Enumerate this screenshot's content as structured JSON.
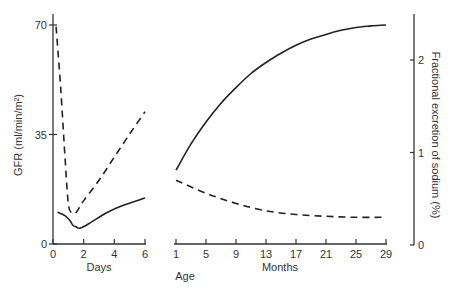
{
  "chart_data": {
    "type": "line",
    "title": "",
    "left_axis": {
      "label": "GFR (ml/min/m²)",
      "ticks": [
        0,
        35,
        70
      ],
      "range": [
        0,
        70
      ]
    },
    "right_axis": {
      "label": "Fractional excretion of sodium (%)",
      "ticks": [
        0,
        1,
        2
      ],
      "range": [
        0,
        2.4
      ]
    },
    "panels": [
      {
        "name": "days",
        "xlabel": "Days",
        "x_ticks": [
          0,
          2,
          4,
          6
        ],
        "xlim": [
          0,
          6
        ],
        "series": [
          {
            "name": "GFR",
            "style": "solid",
            "axis": "left",
            "x": [
              0.3,
              0.8,
              1.1,
              1.3,
              1.5,
              1.8,
              2.5,
              3.5,
              4.5,
              6.0
            ],
            "y": [
              10.2,
              9.0,
              7.5,
              6.0,
              5.5,
              5.1,
              7.0,
              10.0,
              12.2,
              14.7
            ]
          },
          {
            "name": "Fractional excretion of sodium",
            "style": "dashed",
            "axis": "right",
            "x": [
              0.2,
              0.5,
              0.8,
              1.0,
              1.2,
              1.5,
              2.0,
              3.0,
              4.0,
              5.0,
              6.0
            ],
            "y": [
              2.36,
              1.7,
              0.9,
              0.45,
              0.35,
              0.35,
              0.48,
              0.7,
              0.95,
              1.2,
              1.44
            ]
          }
        ]
      },
      {
        "name": "months",
        "xlabel": "Months",
        "x_ticks": [
          1,
          5,
          9,
          13,
          17,
          21,
          25,
          29
        ],
        "xlim": [
          1,
          29
        ],
        "series": [
          {
            "name": "GFR",
            "style": "solid",
            "axis": "left",
            "x": [
              1,
              3,
              5,
              7,
              9,
              11,
              13,
              15,
              17,
              19,
              21,
              23,
              25,
              27,
              29
            ],
            "y": [
              23.6,
              32.0,
              39.0,
              45.0,
              50.0,
              54.5,
              58.0,
              61.0,
              63.5,
              65.5,
              67.0,
              68.3,
              69.2,
              69.7,
              70.0
            ]
          },
          {
            "name": "Fractional excretion of sodium",
            "style": "dashed",
            "axis": "right",
            "x": [
              1,
              5,
              9,
              13,
              17,
              21,
              25,
              29
            ],
            "y": [
              0.7,
              0.56,
              0.45,
              0.37,
              0.33,
              0.31,
              0.3,
              0.3
            ]
          }
        ]
      }
    ],
    "shared_xlabel": "Age",
    "grid": false,
    "legend": null
  },
  "labels": {
    "left_axis_title": "GFR (ml/min/m²)",
    "right_axis_title": "Fractional excretion of sodium (%)",
    "days_label": "Days",
    "months_label": "Months",
    "age_label": "Age"
  }
}
